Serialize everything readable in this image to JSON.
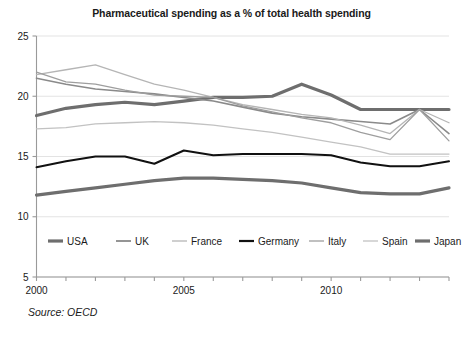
{
  "chart_data": {
    "type": "line",
    "title": "Pharmaceutical spending as a % of total health spending",
    "xlabel": "",
    "ylabel": "",
    "source": "Source: OECD",
    "grid": true,
    "legend_position": "inside-bottom",
    "xlim": [
      2000,
      2014
    ],
    "ylim": [
      5,
      25
    ],
    "yticks": [
      5,
      10,
      15,
      20,
      25
    ],
    "ytick_labels": [
      "5",
      "10",
      "15",
      "20",
      "25"
    ],
    "xticks": [
      2000,
      2005,
      2010
    ],
    "xtick_labels": [
      "2000",
      "2005",
      "2010"
    ],
    "x": [
      2000,
      2001,
      2002,
      2003,
      2004,
      2005,
      2006,
      2007,
      2008,
      2009,
      2010,
      2011,
      2012,
      2013,
      2014
    ],
    "series": [
      {
        "name": "USA",
        "color": "#6e6e6e",
        "width": 3.2,
        "values": [
          18.4,
          19.0,
          19.3,
          19.5,
          19.3,
          19.6,
          19.9,
          19.9,
          20.0,
          21.0,
          20.1,
          18.9,
          18.9,
          18.9,
          18.9
        ]
      },
      {
        "name": "UK",
        "color": "#8a8a8a",
        "width": 1.6,
        "values": [
          21.5,
          21.0,
          20.6,
          20.4,
          20.2,
          19.9,
          19.6,
          19.1,
          18.6,
          18.3,
          18.1,
          17.9,
          17.7,
          18.9,
          16.9
        ]
      },
      {
        "name": "France",
        "color": "#b5b5b5",
        "width": 1.3,
        "values": [
          21.8,
          22.2,
          22.6,
          21.8,
          21.0,
          20.5,
          19.9,
          19.3,
          18.9,
          18.5,
          18.2,
          17.6,
          16.9,
          18.9,
          17.8
        ]
      },
      {
        "name": "Germany",
        "color": "#111111",
        "width": 2.0,
        "values": [
          14.1,
          14.6,
          15.0,
          15.0,
          14.4,
          15.5,
          15.1,
          15.2,
          15.2,
          15.2,
          15.1,
          14.5,
          14.2,
          14.2,
          14.6
        ]
      },
      {
        "name": "Italy",
        "color": "#9e9e9e",
        "width": 1.3,
        "values": [
          22.0,
          21.2,
          21.0,
          20.5,
          20.1,
          20.0,
          19.9,
          19.2,
          18.7,
          18.2,
          17.8,
          17.0,
          16.4,
          18.9,
          16.3
        ]
      },
      {
        "name": "Spain",
        "color": "#c2c2c2",
        "width": 1.3,
        "values": [
          17.3,
          17.4,
          17.7,
          17.8,
          17.9,
          17.8,
          17.6,
          17.3,
          17.0,
          16.6,
          16.2,
          15.8,
          15.2,
          15.2,
          15.2
        ]
      },
      {
        "name": "Japan",
        "color": "#6e6e6e",
        "width": 3.2,
        "values": [
          11.8,
          12.1,
          12.4,
          12.7,
          13.0,
          13.2,
          13.2,
          13.1,
          13.0,
          12.8,
          12.4,
          12.0,
          11.9,
          11.9,
          12.4
        ]
      }
    ],
    "legend_entries": [
      {
        "label": "USA",
        "color": "#6e6e6e",
        "width": 3.2
      },
      {
        "label": "UK",
        "color": "#8a8a8a",
        "width": 1.8
      },
      {
        "label": "France",
        "color": "#b5b5b5",
        "width": 1.3
      },
      {
        "label": "Germany",
        "color": "#111111",
        "width": 2.2
      },
      {
        "label": "Italy",
        "color": "#9e9e9e",
        "width": 1.3
      },
      {
        "label": "Spain",
        "color": "#c2c2c2",
        "width": 1.3
      },
      {
        "label": "Japan",
        "color": "#6e6e6e",
        "width": 3.2
      }
    ]
  }
}
